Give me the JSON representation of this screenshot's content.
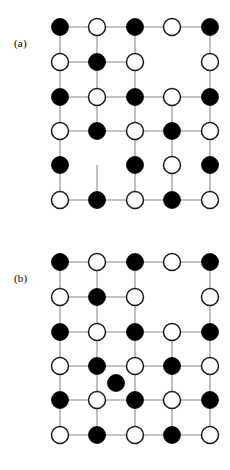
{
  "figure": {
    "width": 230,
    "height": 470,
    "background": "#ffffff",
    "edge_color": "#8a8a8a",
    "filled_node_color": "#000000",
    "open_node_color": "#ffffff",
    "open_node_stroke": "#1a1a1a",
    "node_radius": 8.5
  },
  "chart_data": {
    "type": "scatter",
    "title": "",
    "xlabel": "",
    "ylabel": "",
    "grid": false,
    "legend": null,
    "columns_x": [
      60,
      97,
      135,
      172,
      210
    ],
    "panels": [
      {
        "label": "(a)",
        "label_x": 14,
        "label_y": 38,
        "rows_y": [
          27,
          62,
          97,
          131,
          165,
          200
        ],
        "nodes": [
          {
            "row": 1,
            "col": 1,
            "x": 60,
            "y": 27,
            "state": "filled"
          },
          {
            "row": 1,
            "col": 2,
            "x": 97,
            "y": 27,
            "state": "open"
          },
          {
            "row": 1,
            "col": 3,
            "x": 135,
            "y": 27,
            "state": "filled"
          },
          {
            "row": 1,
            "col": 4,
            "x": 172,
            "y": 27,
            "state": "open"
          },
          {
            "row": 1,
            "col": 5,
            "x": 210,
            "y": 27,
            "state": "filled"
          },
          {
            "row": 2,
            "col": 1,
            "x": 60,
            "y": 62,
            "state": "open"
          },
          {
            "row": 2,
            "col": 2,
            "x": 97,
            "y": 62,
            "state": "filled"
          },
          {
            "row": 2,
            "col": 3,
            "x": 135,
            "y": 62,
            "state": "open"
          },
          {
            "row": 2,
            "col": 5,
            "x": 210,
            "y": 62,
            "state": "open"
          },
          {
            "row": 3,
            "col": 1,
            "x": 60,
            "y": 97,
            "state": "filled"
          },
          {
            "row": 3,
            "col": 2,
            "x": 97,
            "y": 97,
            "state": "open"
          },
          {
            "row": 3,
            "col": 3,
            "x": 135,
            "y": 97,
            "state": "filled"
          },
          {
            "row": 3,
            "col": 4,
            "x": 172,
            "y": 97,
            "state": "open"
          },
          {
            "row": 3,
            "col": 5,
            "x": 210,
            "y": 97,
            "state": "filled"
          },
          {
            "row": 4,
            "col": 1,
            "x": 60,
            "y": 131,
            "state": "open"
          },
          {
            "row": 4,
            "col": 2,
            "x": 97,
            "y": 131,
            "state": "filled"
          },
          {
            "row": 4,
            "col": 3,
            "x": 135,
            "y": 131,
            "state": "open"
          },
          {
            "row": 4,
            "col": 4,
            "x": 172,
            "y": 131,
            "state": "filled"
          },
          {
            "row": 4,
            "col": 5,
            "x": 210,
            "y": 131,
            "state": "open"
          },
          {
            "row": 5,
            "col": 1,
            "x": 60,
            "y": 165,
            "state": "filled"
          },
          {
            "row": 5,
            "col": 3,
            "x": 135,
            "y": 165,
            "state": "filled"
          },
          {
            "row": 5,
            "col": 4,
            "x": 172,
            "y": 165,
            "state": "open"
          },
          {
            "row": 5,
            "col": 5,
            "x": 210,
            "y": 165,
            "state": "filled"
          },
          {
            "row": 6,
            "col": 1,
            "x": 60,
            "y": 200,
            "state": "open"
          },
          {
            "row": 6,
            "col": 2,
            "x": 97,
            "y": 200,
            "state": "filled"
          },
          {
            "row": 6,
            "col": 3,
            "x": 135,
            "y": 200,
            "state": "open"
          },
          {
            "row": 6,
            "col": 4,
            "x": 172,
            "y": 200,
            "state": "filled"
          },
          {
            "row": 6,
            "col": 5,
            "x": 210,
            "y": 200,
            "state": "open"
          }
        ],
        "edges": [
          {
            "x1": 60,
            "y1": 27,
            "x2": 97,
            "y2": 27
          },
          {
            "x1": 97,
            "y1": 27,
            "x2": 135,
            "y2": 27
          },
          {
            "x1": 135,
            "y1": 27,
            "x2": 172,
            "y2": 27
          },
          {
            "x1": 172,
            "y1": 27,
            "x2": 210,
            "y2": 27
          },
          {
            "x1": 60,
            "y1": 62,
            "x2": 97,
            "y2": 62
          },
          {
            "x1": 97,
            "y1": 62,
            "x2": 135,
            "y2": 62
          },
          {
            "x1": 60,
            "y1": 97,
            "x2": 97,
            "y2": 97
          },
          {
            "x1": 97,
            "y1": 97,
            "x2": 135,
            "y2": 97
          },
          {
            "x1": 135,
            "y1": 97,
            "x2": 172,
            "y2": 97
          },
          {
            "x1": 172,
            "y1": 97,
            "x2": 210,
            "y2": 97
          },
          {
            "x1": 60,
            "y1": 131,
            "x2": 97,
            "y2": 131
          },
          {
            "x1": 97,
            "y1": 131,
            "x2": 135,
            "y2": 131
          },
          {
            "x1": 135,
            "y1": 131,
            "x2": 172,
            "y2": 131
          },
          {
            "x1": 172,
            "y1": 131,
            "x2": 210,
            "y2": 131
          },
          {
            "x1": 60,
            "y1": 200,
            "x2": 97,
            "y2": 200
          },
          {
            "x1": 97,
            "y1": 200,
            "x2": 135,
            "y2": 200
          },
          {
            "x1": 135,
            "y1": 200,
            "x2": 172,
            "y2": 200
          },
          {
            "x1": 172,
            "y1": 200,
            "x2": 210,
            "y2": 200
          },
          {
            "x1": 60,
            "y1": 27,
            "x2": 60,
            "y2": 62
          },
          {
            "x1": 60,
            "y1": 62,
            "x2": 60,
            "y2": 97
          },
          {
            "x1": 60,
            "y1": 97,
            "x2": 60,
            "y2": 131
          },
          {
            "x1": 60,
            "y1": 131,
            "x2": 60,
            "y2": 165
          },
          {
            "x1": 60,
            "y1": 165,
            "x2": 60,
            "y2": 200
          },
          {
            "x1": 97,
            "y1": 27,
            "x2": 97,
            "y2": 62
          },
          {
            "x1": 97,
            "y1": 62,
            "x2": 97,
            "y2": 97
          },
          {
            "x1": 97,
            "y1": 97,
            "x2": 97,
            "y2": 131
          },
          {
            "x1": 97,
            "y1": 165,
            "x2": 97,
            "y2": 200
          },
          {
            "x1": 135,
            "y1": 27,
            "x2": 135,
            "y2": 62
          },
          {
            "x1": 135,
            "y1": 62,
            "x2": 135,
            "y2": 97
          },
          {
            "x1": 135,
            "y1": 97,
            "x2": 135,
            "y2": 131
          },
          {
            "x1": 135,
            "y1": 131,
            "x2": 135,
            "y2": 165
          },
          {
            "x1": 135,
            "y1": 165,
            "x2": 135,
            "y2": 200
          },
          {
            "x1": 172,
            "y1": 97,
            "x2": 172,
            "y2": 131
          },
          {
            "x1": 172,
            "y1": 131,
            "x2": 172,
            "y2": 165
          },
          {
            "x1": 172,
            "y1": 165,
            "x2": 172,
            "y2": 200
          },
          {
            "x1": 210,
            "y1": 27,
            "x2": 210,
            "y2": 62
          },
          {
            "x1": 210,
            "y1": 62,
            "x2": 210,
            "y2": 97
          },
          {
            "x1": 210,
            "y1": 97,
            "x2": 210,
            "y2": 131
          },
          {
            "x1": 210,
            "y1": 131,
            "x2": 210,
            "y2": 165
          },
          {
            "x1": 210,
            "y1": 165,
            "x2": 210,
            "y2": 200
          }
        ]
      },
      {
        "label": "(b)",
        "label_x": 14,
        "label_y": 38,
        "rows_y": [
          27,
          62,
          97,
          131,
          165,
          200
        ],
        "nodes": [
          {
            "row": 1,
            "col": 1,
            "x": 60,
            "y": 27,
            "state": "filled"
          },
          {
            "row": 1,
            "col": 2,
            "x": 97,
            "y": 27,
            "state": "open"
          },
          {
            "row": 1,
            "col": 3,
            "x": 135,
            "y": 27,
            "state": "filled"
          },
          {
            "row": 1,
            "col": 4,
            "x": 172,
            "y": 27,
            "state": "open"
          },
          {
            "row": 1,
            "col": 5,
            "x": 210,
            "y": 27,
            "state": "filled"
          },
          {
            "row": 2,
            "col": 1,
            "x": 60,
            "y": 62,
            "state": "open"
          },
          {
            "row": 2,
            "col": 2,
            "x": 97,
            "y": 62,
            "state": "filled"
          },
          {
            "row": 2,
            "col": 3,
            "x": 135,
            "y": 62,
            "state": "open"
          },
          {
            "row": 2,
            "col": 5,
            "x": 210,
            "y": 62,
            "state": "open"
          },
          {
            "row": 3,
            "col": 1,
            "x": 60,
            "y": 97,
            "state": "filled"
          },
          {
            "row": 3,
            "col": 2,
            "x": 97,
            "y": 97,
            "state": "open"
          },
          {
            "row": 3,
            "col": 3,
            "x": 135,
            "y": 97,
            "state": "filled"
          },
          {
            "row": 3,
            "col": 4,
            "x": 172,
            "y": 97,
            "state": "open"
          },
          {
            "row": 3,
            "col": 5,
            "x": 210,
            "y": 97,
            "state": "filled"
          },
          {
            "row": 4,
            "col": 1,
            "x": 60,
            "y": 131,
            "state": "open"
          },
          {
            "row": 4,
            "col": 2,
            "x": 97,
            "y": 131,
            "state": "filled"
          },
          {
            "row": 4,
            "col": 3,
            "x": 135,
            "y": 131,
            "state": "open"
          },
          {
            "row": 4,
            "col": 4,
            "x": 172,
            "y": 131,
            "state": "filled"
          },
          {
            "row": 4,
            "col": 5,
            "x": 210,
            "y": 131,
            "state": "open"
          },
          {
            "row": 0,
            "col": 0,
            "x": 116,
            "y": 148,
            "state": "filled",
            "interstitial": true
          },
          {
            "row": 5,
            "col": 1,
            "x": 60,
            "y": 165,
            "state": "filled"
          },
          {
            "row": 5,
            "col": 2,
            "x": 97,
            "y": 165,
            "state": "open"
          },
          {
            "row": 5,
            "col": 3,
            "x": 135,
            "y": 165,
            "state": "filled"
          },
          {
            "row": 5,
            "col": 4,
            "x": 172,
            "y": 165,
            "state": "open"
          },
          {
            "row": 5,
            "col": 5,
            "x": 210,
            "y": 165,
            "state": "filled"
          },
          {
            "row": 6,
            "col": 1,
            "x": 60,
            "y": 200,
            "state": "open"
          },
          {
            "row": 6,
            "col": 2,
            "x": 97,
            "y": 200,
            "state": "filled"
          },
          {
            "row": 6,
            "col": 3,
            "x": 135,
            "y": 200,
            "state": "open"
          },
          {
            "row": 6,
            "col": 4,
            "x": 172,
            "y": 200,
            "state": "filled"
          },
          {
            "row": 6,
            "col": 5,
            "x": 210,
            "y": 200,
            "state": "open"
          }
        ],
        "edges": [
          {
            "x1": 60,
            "y1": 27,
            "x2": 97,
            "y2": 27
          },
          {
            "x1": 97,
            "y1": 27,
            "x2": 135,
            "y2": 27
          },
          {
            "x1": 135,
            "y1": 27,
            "x2": 172,
            "y2": 27
          },
          {
            "x1": 172,
            "y1": 27,
            "x2": 210,
            "y2": 27
          },
          {
            "x1": 60,
            "y1": 62,
            "x2": 97,
            "y2": 62
          },
          {
            "x1": 97,
            "y1": 62,
            "x2": 135,
            "y2": 62
          },
          {
            "x1": 60,
            "y1": 97,
            "x2": 97,
            "y2": 97
          },
          {
            "x1": 97,
            "y1": 97,
            "x2": 135,
            "y2": 97
          },
          {
            "x1": 135,
            "y1": 97,
            "x2": 172,
            "y2": 97
          },
          {
            "x1": 172,
            "y1": 97,
            "x2": 210,
            "y2": 97
          },
          {
            "x1": 60,
            "y1": 131,
            "x2": 97,
            "y2": 131
          },
          {
            "x1": 97,
            "y1": 131,
            "x2": 135,
            "y2": 131
          },
          {
            "x1": 135,
            "y1": 131,
            "x2": 172,
            "y2": 131
          },
          {
            "x1": 172,
            "y1": 131,
            "x2": 210,
            "y2": 131
          },
          {
            "x1": 60,
            "y1": 165,
            "x2": 97,
            "y2": 165
          },
          {
            "x1": 97,
            "y1": 165,
            "x2": 135,
            "y2": 165
          },
          {
            "x1": 135,
            "y1": 165,
            "x2": 172,
            "y2": 165
          },
          {
            "x1": 172,
            "y1": 165,
            "x2": 210,
            "y2": 165
          },
          {
            "x1": 60,
            "y1": 200,
            "x2": 97,
            "y2": 200
          },
          {
            "x1": 97,
            "y1": 200,
            "x2": 135,
            "y2": 200
          },
          {
            "x1": 135,
            "y1": 200,
            "x2": 172,
            "y2": 200
          },
          {
            "x1": 172,
            "y1": 200,
            "x2": 210,
            "y2": 200
          },
          {
            "x1": 60,
            "y1": 27,
            "x2": 60,
            "y2": 62
          },
          {
            "x1": 60,
            "y1": 62,
            "x2": 60,
            "y2": 97
          },
          {
            "x1": 60,
            "y1": 97,
            "x2": 60,
            "y2": 131
          },
          {
            "x1": 60,
            "y1": 131,
            "x2": 60,
            "y2": 165
          },
          {
            "x1": 60,
            "y1": 165,
            "x2": 60,
            "y2": 200
          },
          {
            "x1": 97,
            "y1": 27,
            "x2": 97,
            "y2": 62
          },
          {
            "x1": 97,
            "y1": 62,
            "x2": 97,
            "y2": 97
          },
          {
            "x1": 97,
            "y1": 97,
            "x2": 97,
            "y2": 131
          },
          {
            "x1": 97,
            "y1": 131,
            "x2": 97,
            "y2": 165
          },
          {
            "x1": 97,
            "y1": 165,
            "x2": 97,
            "y2": 200
          },
          {
            "x1": 135,
            "y1": 27,
            "x2": 135,
            "y2": 62
          },
          {
            "x1": 135,
            "y1": 62,
            "x2": 135,
            "y2": 97
          },
          {
            "x1": 135,
            "y1": 97,
            "x2": 135,
            "y2": 131
          },
          {
            "x1": 135,
            "y1": 131,
            "x2": 135,
            "y2": 165
          },
          {
            "x1": 135,
            "y1": 165,
            "x2": 135,
            "y2": 200
          },
          {
            "x1": 172,
            "y1": 97,
            "x2": 172,
            "y2": 131
          },
          {
            "x1": 172,
            "y1": 131,
            "x2": 172,
            "y2": 165
          },
          {
            "x1": 172,
            "y1": 165,
            "x2": 172,
            "y2": 200
          },
          {
            "x1": 210,
            "y1": 27,
            "x2": 210,
            "y2": 62
          },
          {
            "x1": 210,
            "y1": 62,
            "x2": 210,
            "y2": 97
          },
          {
            "x1": 210,
            "y1": 97,
            "x2": 210,
            "y2": 131
          },
          {
            "x1": 210,
            "y1": 131,
            "x2": 210,
            "y2": 165
          },
          {
            "x1": 210,
            "y1": 165,
            "x2": 210,
            "y2": 200
          }
        ]
      }
    ]
  }
}
